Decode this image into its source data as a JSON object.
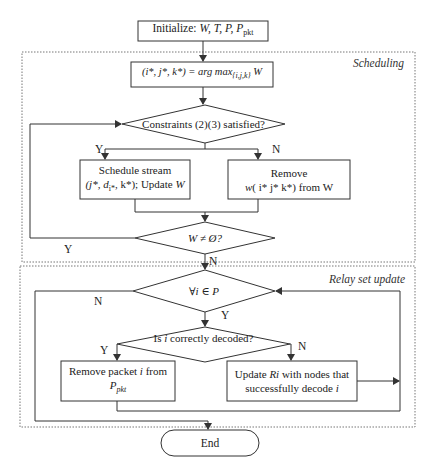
{
  "nodes": {
    "init": {
      "prefix": "Initialize: ",
      "vars": "W, T, P, P",
      "sub": "pkt"
    },
    "argmax": {
      "lhs": "(i*, j*, k*) = arg max",
      "sub": "{i,j,k}",
      "rhs": " W"
    },
    "constraints": {
      "text": "Constraints (2)(3) satisfied?"
    },
    "schedule": {
      "line1": "Schedule stream",
      "line2a": "(j*, d",
      "line2sub": "i*",
      "line2b": ", k*); Update ",
      "line2c": "W"
    },
    "remove_w": {
      "line1": "Remove",
      "line2a": "w",
      "line2b": "( i* j* k*) from W"
    },
    "w_nonempty": {
      "text": "W ≠ Ø?"
    },
    "forall": {
      "text": "∀i ∈ P"
    },
    "decoded": {
      "a": "Is ",
      "b": "i",
      "c": " correctly decoded?"
    },
    "remove_packet": {
      "line1a": "Remove packet ",
      "line1b": "i",
      "line1c": " from",
      "line2": "P",
      "line2sub": "pkt"
    },
    "update_ri": {
      "line1a": "Update ",
      "line1b": "Ri",
      "line1c": " with nodes that",
      "line2a": "successfully decode ",
      "line2b": "i"
    },
    "end": {
      "text": "End"
    }
  },
  "regions": {
    "scheduling": "Scheduling",
    "relay": "Relay set update"
  },
  "edge_labels": {
    "constraints_yes": "Y",
    "constraints_no": "N",
    "w_yes": "Y",
    "w_no": "N",
    "forall_no": "N",
    "forall_yes": "Y",
    "decoded_yes": "Y",
    "decoded_no": "N"
  },
  "colors": {
    "stroke": "#333333",
    "dashed": "#777777",
    "background": "#ffffff"
  }
}
